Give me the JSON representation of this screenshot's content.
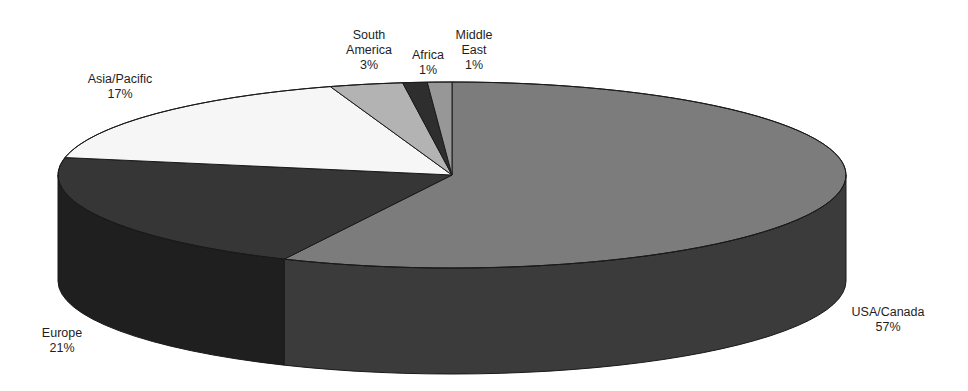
{
  "chart_data": {
    "type": "pie",
    "style": "3d-exploded-none",
    "title": "",
    "xlabel": "",
    "ylabel": "",
    "legend": "none",
    "grid": false,
    "direction": "clockwise",
    "start_angle_deg": 0,
    "categories": [
      "USA/Canada",
      "Europe",
      "Asia/Pacific",
      "South America",
      "Africa",
      "Middle East"
    ],
    "values": [
      57,
      21,
      17,
      3,
      1,
      1
    ],
    "unit": "%",
    "slices": [
      {
        "name": "USA/Canada",
        "value": 57,
        "label_lines": [
          "USA/Canada",
          "57%"
        ],
        "color_top": "#7c7c7c",
        "color_side": "#3b3b3b",
        "label_x": 888,
        "label_y": 312
      },
      {
        "name": "Europe",
        "value": 21,
        "label_lines": [
          "Europe",
          "21%"
        ],
        "color_top": "#363636",
        "color_side": "#1f1f1f",
        "label_x": 62,
        "label_y": 333
      },
      {
        "name": "Asia/Pacific",
        "value": 17,
        "label_lines": [
          "Asia/Pacific",
          "17%"
        ],
        "color_top": "#f6f6f6",
        "color_side": "#c8c8c8",
        "label_x": 120,
        "label_y": 79
      },
      {
        "name": "South America",
        "value": 3,
        "label_lines": [
          "South",
          "America",
          "3%"
        ],
        "color_top": "#b3b3b3",
        "color_side": "#777777",
        "label_x": 369,
        "label_y": 35
      },
      {
        "name": "Africa",
        "value": 1,
        "label_lines": [
          "Africa",
          "1%"
        ],
        "color_top": "#2e2e2e",
        "color_side": "#1a1a1a",
        "label_x": 428,
        "label_y": 55
      },
      {
        "name": "Middle East",
        "value": 1,
        "label_lines": [
          "Middle",
          "East",
          "1%"
        ],
        "color_top": "#979797",
        "color_side": "#555555",
        "label_x": 474,
        "label_y": 35
      }
    ],
    "layout": {
      "cx": 452,
      "cy": 175,
      "rx": 394,
      "ry": 93,
      "depth": 106,
      "font_size": 12.5,
      "line_height": 15
    }
  }
}
